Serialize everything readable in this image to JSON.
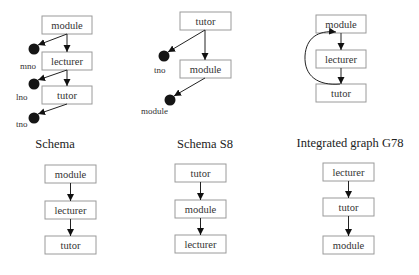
{
  "panels": [
    {
      "id": "schema",
      "caption": "Schema",
      "top_graph": {
        "nodes": [
          "module",
          "lecturer",
          "tutor"
        ],
        "attributes": [
          "mno",
          "lno",
          "tno"
        ]
      },
      "bottom_graph": {
        "nodes": [
          "module",
          "lecturer",
          "tutor"
        ]
      }
    },
    {
      "id": "schema-s8",
      "caption": "Schema S8",
      "top_graph": {
        "nodes": [
          "tutor",
          "module"
        ],
        "attributes": [
          "tno",
          "module"
        ]
      },
      "bottom_graph": {
        "nodes": [
          "tutor",
          "module",
          "lecturer"
        ]
      }
    },
    {
      "id": "integrated-g78",
      "caption": "Integrated graph G78",
      "top_graph": {
        "nodes": [
          "module",
          "lecturer",
          "tutor"
        ],
        "cycle_edge": "tutor -> module"
      },
      "bottom_graph": {
        "nodes": [
          "lecturer",
          "tutor",
          "module"
        ]
      }
    }
  ],
  "colors": {
    "box_border": "#9a9a9a",
    "edge": "#222222",
    "attribute_dot": "#151515",
    "background": "#ffffff"
  }
}
